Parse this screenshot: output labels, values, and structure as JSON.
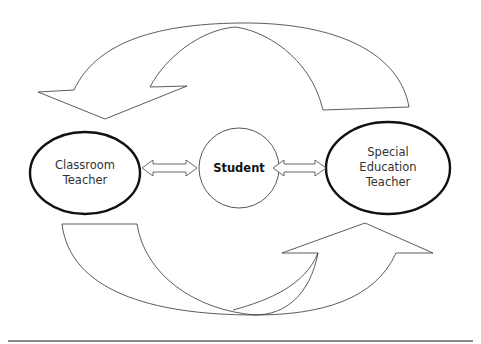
{
  "diagram": {
    "nodes": [
      {
        "id": "classroom-teacher",
        "label_line1": "Classroom",
        "label_line2": "Teacher",
        "shape": "ellipse",
        "border": "thick"
      },
      {
        "id": "student",
        "label": "Student",
        "shape": "circle",
        "border": "thin",
        "bold": true
      },
      {
        "id": "special-education-teacher",
        "label_line1": "Special",
        "label_line2": "Education",
        "label_line3": "Teacher",
        "shape": "ellipse",
        "border": "thick"
      }
    ],
    "connectors": [
      {
        "from": "classroom-teacher",
        "to": "student",
        "type": "double-arrow"
      },
      {
        "from": "student",
        "to": "special-education-teacher",
        "type": "double-arrow"
      }
    ],
    "curved_arrows": [
      {
        "position": "top",
        "from": "special-education-teacher",
        "to": "classroom-teacher"
      },
      {
        "position": "bottom",
        "from": "classroom-teacher",
        "to": "special-education-teacher"
      }
    ],
    "colors": {
      "stroke": "#333333",
      "background": "#ffffff",
      "rule": "#8a8a8a"
    }
  }
}
